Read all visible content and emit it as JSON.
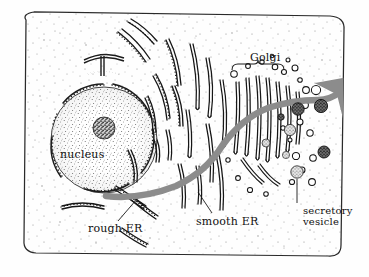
{
  "figure": {
    "kind": "cell-biology-illustration",
    "style": "hand-drawn stippled line art",
    "colors": {
      "ink": "#111111",
      "background": "#fefefe",
      "pathway_arrow": "#8c8c8c",
      "stipple": "#8a8a8a",
      "vesicle_dark": "#3a3a3a",
      "vesicle_light": "#9a9a9a"
    }
  },
  "labels": {
    "nucleus": "nucleus",
    "golgi": "Golgi",
    "rough_er": "rough ER",
    "smooth_er": "smooth ER",
    "secretory_line1": "secretory",
    "secretory_line2": "vesicle"
  },
  "structures": [
    {
      "name": "cell-membrane",
      "shape": "rounded-rectangle",
      "note": "outer boundary of cell"
    },
    {
      "name": "nucleus",
      "shape": "stippled-circle",
      "note": "large stippled sphere at left"
    },
    {
      "name": "nucleolus",
      "shape": "dark-stippled-circle",
      "note": "dense dark body inside nucleus"
    },
    {
      "name": "nuclear-envelope",
      "shape": "dashed-ring",
      "note": "ribosome-studded ring around nucleus"
    },
    {
      "name": "rough-er",
      "shape": "studded-curved-tubes",
      "note": "cisternae with ribosome dots near nucleus"
    },
    {
      "name": "smooth-er",
      "shape": "plain-curved-tubes",
      "note": "smooth tubules center of cell"
    },
    {
      "name": "golgi",
      "shape": "stacked-cisternae",
      "note": "stack of flattened sacs at right with budding vesicles"
    },
    {
      "name": "transport-vesicles",
      "shape": "small-circles",
      "note": "open circles around Golgi"
    },
    {
      "name": "secretory-vesicles",
      "shape": "filled-stippled-circles",
      "note": "dark filled vesicles at right"
    },
    {
      "name": "pathway-arrow",
      "shape": "thick-gray-arrow",
      "note": "gray route from nucleus through ER and Golgi, exiting cell at upper right"
    }
  ],
  "leaders": [
    {
      "name": "rough-er-leader",
      "from": "rough ER label",
      "to": "studded ER tubule"
    },
    {
      "name": "smooth-er-leader",
      "from": "smooth ER label",
      "to": "smooth ER tubule"
    },
    {
      "name": "secretory-vesicle-leader",
      "from": "secretory vesicle label",
      "to": "filled vesicle"
    },
    {
      "name": "golgi-brace",
      "from": "Golgi label",
      "to": "Golgi stack"
    }
  ]
}
